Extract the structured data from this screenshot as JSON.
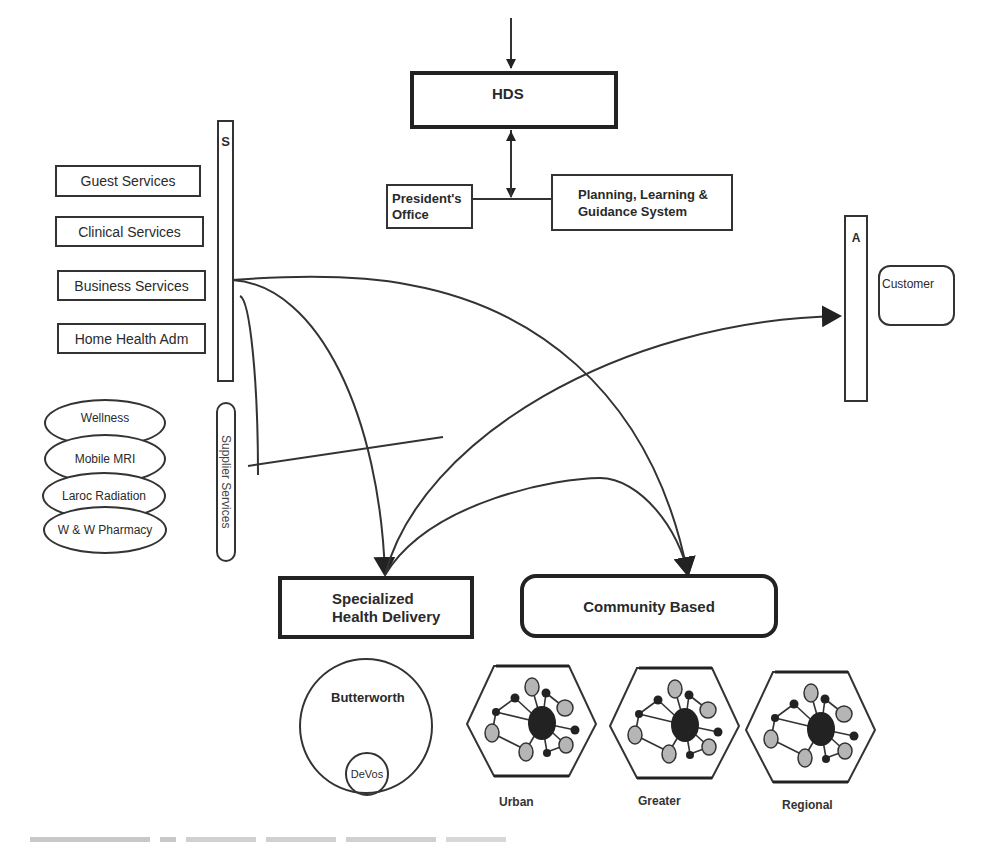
{
  "top": {
    "hds_label": "HDS",
    "presidents_office_label": "President's Office",
    "planning_label_line1": "Planning, Learning &",
    "planning_label_line2": "Guidance System"
  },
  "left": {
    "s_bar_label": "S",
    "services": [
      {
        "label": "Guest Services"
      },
      {
        "label": "Clinical Services"
      },
      {
        "label": "Business Services"
      },
      {
        "label": "Home Health Adm"
      }
    ],
    "ovals": [
      {
        "label": "Wellness"
      },
      {
        "label": "Mobile MRI"
      },
      {
        "label": "Laroc Radiation"
      },
      {
        "label": "W & W Pharmacy"
      }
    ],
    "supplier_label": "Supplier Services"
  },
  "right": {
    "a_bar_label": "A",
    "customer_label": "Customer"
  },
  "bottom": {
    "specialized_line1": "Specialized",
    "specialized_line2": "Health Delivery",
    "community_label": "Community Based",
    "butterworth_label": "Butterworth",
    "devos_label": "DeVos",
    "networks": [
      {
        "label": "Urban"
      },
      {
        "label": "Greater"
      },
      {
        "label": "Regional"
      }
    ]
  },
  "colors": {
    "line": "#333333",
    "node_dark": "#222222",
    "node_gray": "#b5b5b5"
  }
}
